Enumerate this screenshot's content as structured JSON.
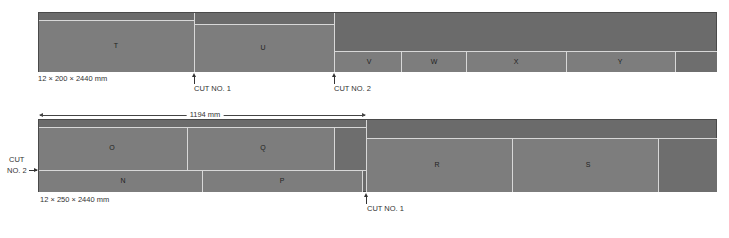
{
  "top_board": {
    "dimension_label": "12 × 200 × 2440 mm",
    "pieces": [
      {
        "id": "T",
        "label": "T"
      },
      {
        "id": "U",
        "label": "U"
      },
      {
        "id": "V",
        "label": "V"
      },
      {
        "id": "W",
        "label": "W"
      },
      {
        "id": "X",
        "label": "X"
      },
      {
        "id": "Y",
        "label": "Y"
      }
    ],
    "cuts": [
      {
        "label": "CUT NO. 1"
      },
      {
        "label": "CUT NO. 2"
      }
    ]
  },
  "bottom_board": {
    "dimension_label": "12 × 250 × 2440 mm",
    "length_dimension": "1194 mm",
    "pieces": [
      {
        "id": "O",
        "label": "O"
      },
      {
        "id": "Q",
        "label": "Q"
      },
      {
        "id": "N",
        "label": "N"
      },
      {
        "id": "P",
        "label": "P"
      },
      {
        "id": "R",
        "label": "R"
      },
      {
        "id": "S",
        "label": "S"
      }
    ],
    "cuts": [
      {
        "label": "CUT NO. 1"
      },
      {
        "label_line1": "CUT",
        "label_line2": "NO. 2"
      }
    ]
  },
  "colors": {
    "board": "#6b6b6b",
    "piece": "#7d7d7d",
    "cut_line": "#d8d8d8"
  }
}
